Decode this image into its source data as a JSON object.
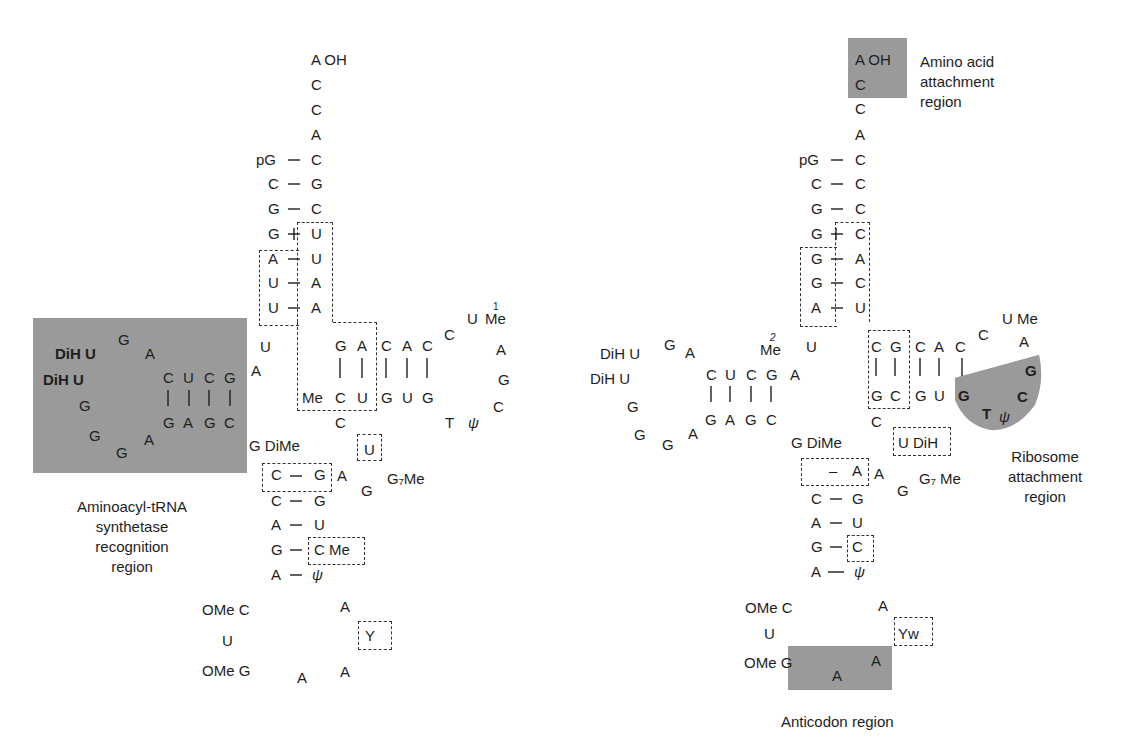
{
  "figure": {
    "left_panel": {
      "acceptor_stem": {
        "tail": [
          "A OH",
          "C",
          "C",
          "A"
        ],
        "pairs": [
          [
            "pG",
            "C"
          ],
          [
            "C",
            "G"
          ],
          [
            "G",
            "C"
          ],
          [
            "G",
            "U"
          ],
          [
            "A",
            "U"
          ],
          [
            "U",
            "A"
          ],
          [
            "U",
            "A"
          ]
        ]
      },
      "d_arm": {
        "loop_left": [
          "DiH U",
          "DiH U",
          "G",
          "G",
          "G"
        ],
        "loop_top": [
          "G",
          "A"
        ],
        "loop_bottom": [
          "A"
        ],
        "stem_top": [
          "C",
          "U",
          "C",
          "G"
        ],
        "stem_bottom": [
          "G",
          "A",
          "G",
          "C"
        ]
      },
      "junction": [
        "U",
        "A"
      ],
      "t_arm": {
        "stem_top": [
          "G",
          "A",
          "C",
          "A",
          "C"
        ],
        "stem_bottom_prefix": "Me",
        "stem_bottom": [
          "C",
          "U",
          "G",
          "U",
          "G"
        ],
        "loop": [
          "C",
          "U",
          "Me",
          "A",
          "G",
          "C",
          "T",
          "ψ"
        ],
        "me_superscript": "1"
      },
      "variable_loop": [
        "C",
        "U",
        "A",
        "G",
        "G₇Me"
      ],
      "g_dime": "G DiMe",
      "anticodon_stem": {
        "pairs": [
          [
            "C",
            "G"
          ],
          [
            "C",
            "G"
          ],
          [
            "A",
            "U"
          ],
          [
            "G",
            "C Me"
          ],
          [
            "A",
            "ψ"
          ]
        ]
      },
      "anticodon_loop": [
        "OMe C",
        "U",
        "OMe G",
        "A",
        "A",
        "Y",
        "A"
      ],
      "region_label": [
        "Aminoacyl-tRNA",
        "synthetase",
        "recognition",
        "region"
      ]
    },
    "right_panel": {
      "acceptor_stem": {
        "tail": [
          "A OH",
          "C",
          "C",
          "A"
        ],
        "pairs": [
          [
            "pG",
            "C"
          ],
          [
            "C",
            "C"
          ],
          [
            "G",
            "C"
          ],
          [
            "G",
            "C"
          ],
          [
            "G",
            "A"
          ],
          [
            "G",
            "C"
          ],
          [
            "A",
            "U"
          ]
        ]
      },
      "d_arm": {
        "loop_left": [
          "DiH U",
          "DiH U",
          "G",
          "G",
          "G"
        ],
        "loop_top": [
          "G",
          "A"
        ],
        "loop_bottom": [
          "A"
        ],
        "stem_top": [
          "C",
          "U",
          "C",
          "G",
          "A"
        ],
        "stem_bottom": [
          "G",
          "A",
          "G",
          "C"
        ],
        "me_label": "Me",
        "me_superscript": "2"
      },
      "junction": [
        "U",
        "A"
      ],
      "t_arm": {
        "stem_top": [
          "C",
          "G",
          "C",
          "A",
          "C"
        ],
        "stem_bottom": [
          "G",
          "C",
          "G",
          "U",
          "G"
        ],
        "loop": [
          "C",
          "U Me",
          "A",
          "G",
          "C",
          "T",
          "ψ"
        ]
      },
      "variable_loop": [
        "C",
        "U DiH",
        "A",
        "G",
        "G₇ Me"
      ],
      "g_dime": "G DiMe",
      "anticodon_stem": {
        "pairs": [
          [
            "",
            "A"
          ],
          [
            "C",
            "G"
          ],
          [
            "A",
            "U"
          ],
          [
            "G",
            "C"
          ],
          [
            "A",
            "ψ"
          ]
        ]
      },
      "anticodon_loop": [
        "OMe C",
        "U",
        "OMe G",
        "A",
        "A",
        "Yw",
        "A"
      ],
      "labels": {
        "amino_acid": [
          "Amino acid",
          "attachment",
          "region"
        ],
        "ribosome": [
          "Ribosome",
          "attachment",
          "region"
        ],
        "anticodon": "Anticodon region"
      }
    },
    "colors": {
      "shade": "#9a9a9a",
      "text": "#1e1e1e",
      "dash": "#333333"
    }
  }
}
